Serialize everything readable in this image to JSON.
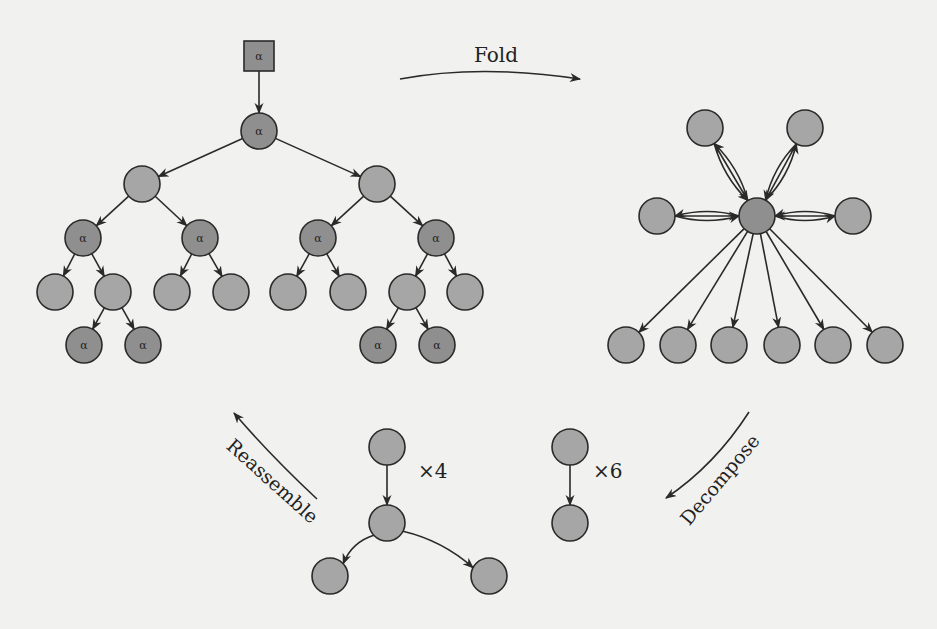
{
  "figure": {
    "colors": {
      "background": "#f1f1ef",
      "node_fill": "#a6a6a6",
      "alpha_node_fill": "#8f8f8f",
      "stroke": "#2a2a2a"
    },
    "labels": {
      "fold": "Fold",
      "reassemble": "Reassemble",
      "decompose": "Decompose",
      "times4": "×4",
      "times6": "×6",
      "alpha": "α"
    },
    "tree": {
      "square": {
        "x": 259,
        "y": 56,
        "label": "α"
      },
      "nodes": [
        {
          "id": "r",
          "x": 259,
          "y": 131,
          "alpha": true
        },
        {
          "id": "a",
          "x": 142,
          "y": 184,
          "alpha": false
        },
        {
          "id": "b",
          "x": 377,
          "y": 184,
          "alpha": false
        },
        {
          "id": "a1",
          "x": 83,
          "y": 238,
          "alpha": true
        },
        {
          "id": "a2",
          "x": 200,
          "y": 238,
          "alpha": true
        },
        {
          "id": "b1",
          "x": 318,
          "y": 238,
          "alpha": true
        },
        {
          "id": "b2",
          "x": 436,
          "y": 238,
          "alpha": true
        },
        {
          "id": "l1",
          "x": 55,
          "y": 292,
          "alpha": false
        },
        {
          "id": "l2",
          "x": 113,
          "y": 292,
          "alpha": false
        },
        {
          "id": "l3",
          "x": 172,
          "y": 292,
          "alpha": false
        },
        {
          "id": "l4",
          "x": 231,
          "y": 292,
          "alpha": false
        },
        {
          "id": "l5",
          "x": 288,
          "y": 292,
          "alpha": false
        },
        {
          "id": "l6",
          "x": 348,
          "y": 292,
          "alpha": false
        },
        {
          "id": "l7",
          "x": 407,
          "y": 292,
          "alpha": false
        },
        {
          "id": "l8",
          "x": 465,
          "y": 292,
          "alpha": false
        },
        {
          "id": "m1",
          "x": 84,
          "y": 345,
          "alpha": true
        },
        {
          "id": "m2",
          "x": 143,
          "y": 345,
          "alpha": true
        },
        {
          "id": "m3",
          "x": 378,
          "y": 345,
          "alpha": true
        },
        {
          "id": "m4",
          "x": 437,
          "y": 345,
          "alpha": true
        }
      ],
      "edges": [
        [
          "r",
          "a"
        ],
        [
          "r",
          "b"
        ],
        [
          "a",
          "a1"
        ],
        [
          "a",
          "a2"
        ],
        [
          "b",
          "b1"
        ],
        [
          "b",
          "b2"
        ],
        [
          "a1",
          "l1"
        ],
        [
          "a1",
          "l2"
        ],
        [
          "a2",
          "l3"
        ],
        [
          "a2",
          "l4"
        ],
        [
          "b1",
          "l5"
        ],
        [
          "b1",
          "l6"
        ],
        [
          "b2",
          "l7"
        ],
        [
          "b2",
          "l8"
        ],
        [
          "l2",
          "m1"
        ],
        [
          "l2",
          "m2"
        ],
        [
          "l7",
          "m3"
        ],
        [
          "l7",
          "m4"
        ]
      ]
    },
    "star": {
      "center": {
        "x": 757,
        "y": 216
      },
      "bidirectional": [
        {
          "x": 705,
          "y": 128
        },
        {
          "x": 805,
          "y": 128
        },
        {
          "x": 657,
          "y": 216
        },
        {
          "x": 853,
          "y": 216
        }
      ],
      "outgoing": [
        {
          "x": 626,
          "y": 345
        },
        {
          "x": 678,
          "y": 345
        },
        {
          "x": 729,
          "y": 345
        },
        {
          "x": 782,
          "y": 345
        },
        {
          "x": 833,
          "y": 345
        },
        {
          "x": 885,
          "y": 345
        }
      ]
    },
    "pieces": {
      "x4": {
        "nodes": [
          {
            "id": "t",
            "x": 387,
            "y": 447
          },
          {
            "id": "m",
            "x": 387,
            "y": 523
          },
          {
            "id": "c1",
            "x": 330,
            "y": 576
          },
          {
            "id": "c2",
            "x": 489,
            "y": 576
          }
        ],
        "edges": [
          [
            "t",
            "m"
          ],
          [
            "m",
            "c1"
          ],
          [
            "m",
            "c2"
          ]
        ],
        "label_pos": {
          "x": 418,
          "y": 478
        }
      },
      "x6": {
        "nodes": [
          {
            "id": "t",
            "x": 570,
            "y": 447
          },
          {
            "id": "b",
            "x": 570,
            "y": 523
          }
        ],
        "edges": [
          [
            "t",
            "b"
          ]
        ],
        "label_pos": {
          "x": 593,
          "y": 478
        }
      }
    }
  }
}
